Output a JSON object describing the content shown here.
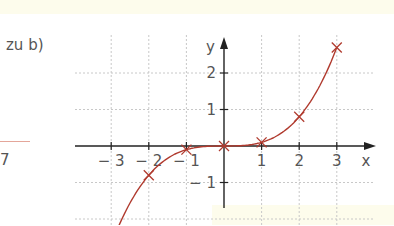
{
  "side_text": {
    "label": "zu b)",
    "fragment_digit": "7"
  },
  "chart_data": {
    "type": "line",
    "title": "",
    "function": "f(x) = x^3 / 10",
    "xlabel": "x",
    "ylabel": "y",
    "xlim": [
      -3.3,
      4.1
    ],
    "ylim": [
      -2.1,
      3.0
    ],
    "grid": true,
    "x_ticks": [
      "-3",
      "-2",
      "-1",
      "1",
      "2",
      "3"
    ],
    "y_ticks": [
      "2",
      "1",
      "-1"
    ],
    "series": [
      {
        "name": "f",
        "color": "#b03a2e",
        "marked_points": [
          {
            "x": -2,
            "y": -0.8
          },
          {
            "x": -1,
            "y": -0.1
          },
          {
            "x": 0,
            "y": 0
          },
          {
            "x": 1,
            "y": 0.1
          },
          {
            "x": 2,
            "y": 0.8
          },
          {
            "x": 3,
            "y": 2.7
          }
        ]
      }
    ]
  },
  "colors": {
    "curve": "#b03a2e",
    "axis": "#222222",
    "grid": "#c8c8c8",
    "text": "#555555"
  }
}
